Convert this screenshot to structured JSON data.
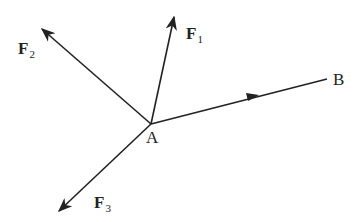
{
  "diagram": {
    "title": "",
    "origin": {
      "label": "A",
      "x": 151,
      "y": 124
    },
    "vectors": [
      {
        "id": "F1",
        "label": "F",
        "subscript": "1",
        "tip": [
          174,
          16
        ]
      },
      {
        "id": "F2",
        "label": "F",
        "subscript": "2",
        "tip": [
          41,
          28
        ]
      },
      {
        "id": "F3",
        "label": "F",
        "subscript": "3",
        "tip": [
          58,
          212
        ]
      }
    ],
    "line_AB": {
      "from": "A",
      "to": "B",
      "end": [
        327,
        79
      ],
      "arrow_mid": [
        253,
        97
      ]
    },
    "labels": {
      "A": "A",
      "B": "B",
      "F": "F",
      "s1": "1",
      "s2": "2",
      "s3": "3"
    },
    "colors": {
      "stroke": "#222222",
      "background": "#ffffff"
    }
  }
}
